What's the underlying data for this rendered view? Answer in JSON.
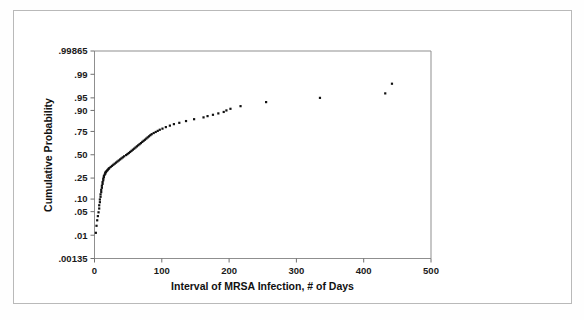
{
  "figure": {
    "background_color": "#ffffff",
    "border_color": "#b9b9b9",
    "frame_color": "#8f8f8f",
    "point_color": "#111111"
  },
  "chart_data": {
    "type": "scatter",
    "title": "",
    "subtitle": "",
    "xlabel": "Interval of MRSA Infection, # of Days",
    "ylabel": "Cumulative Probability",
    "y_scale": "normal-probability",
    "x_scale": "linear",
    "xlim": [
      0,
      500
    ],
    "ylim": [
      0.00135,
      0.99865
    ],
    "grid": false,
    "legend": null,
    "legend_position": "none",
    "xticks": [
      0,
      100,
      200,
      300,
      400,
      500
    ],
    "xtick_labels": [
      "0",
      "100",
      "200",
      "300",
      "400",
      "500"
    ],
    "yticks": [
      0.00135,
      0.01,
      0.05,
      0.1,
      0.25,
      0.5,
      0.75,
      0.9,
      0.95,
      0.99,
      0.99865
    ],
    "ytick_labels": [
      ".00135",
      ".01",
      ".05",
      ".10",
      ".25",
      ".50",
      ".75",
      ".90",
      ".95",
      ".99",
      ".99865"
    ],
    "marker": "square",
    "marker_size": 2.2,
    "series": [
      {
        "name": "MRSA infection interval",
        "x": [
          2,
          3,
          4,
          5,
          6,
          7,
          7,
          8,
          8,
          9,
          9,
          10,
          10,
          11,
          11,
          12,
          12,
          13,
          13,
          14,
          14,
          15,
          16,
          16,
          17,
          18,
          19,
          20,
          21,
          22,
          24,
          26,
          28,
          30,
          32,
          34,
          36,
          38,
          40,
          42,
          44,
          47,
          49,
          51,
          53,
          55,
          57,
          59,
          61,
          63,
          65,
          67,
          69,
          71,
          73,
          75,
          77,
          79,
          81,
          83,
          85,
          88,
          91,
          94,
          97,
          101,
          106,
          112,
          118,
          126,
          136,
          148,
          162,
          168,
          176,
          184,
          192,
          196,
          202,
          217,
          255,
          335,
          432,
          442
        ],
        "y": [
          0.012,
          0.02,
          0.029,
          0.038,
          0.048,
          0.06,
          0.072,
          0.085,
          0.098,
          0.112,
          0.126,
          0.14,
          0.155,
          0.17,
          0.185,
          0.2,
          0.215,
          0.23,
          0.245,
          0.258,
          0.27,
          0.282,
          0.292,
          0.302,
          0.31,
          0.318,
          0.326,
          0.334,
          0.342,
          0.35,
          0.362,
          0.374,
          0.386,
          0.398,
          0.41,
          0.422,
          0.434,
          0.446,
          0.458,
          0.47,
          0.482,
          0.496,
          0.508,
          0.52,
          0.532,
          0.545,
          0.558,
          0.57,
          0.583,
          0.596,
          0.608,
          0.62,
          0.632,
          0.645,
          0.657,
          0.668,
          0.68,
          0.692,
          0.703,
          0.714,
          0.724,
          0.735,
          0.745,
          0.755,
          0.765,
          0.775,
          0.788,
          0.8,
          0.812,
          0.822,
          0.835,
          0.848,
          0.86,
          0.868,
          0.876,
          0.884,
          0.892,
          0.9,
          0.908,
          0.92,
          0.936,
          0.95,
          0.962,
          0.98
        ]
      }
    ]
  }
}
